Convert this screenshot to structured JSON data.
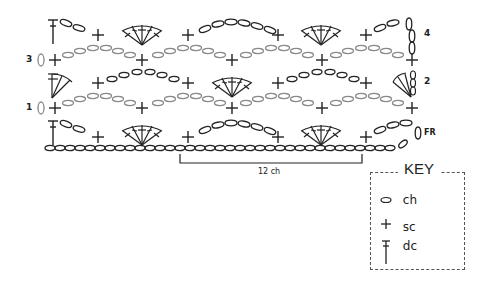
{
  "diagram": {
    "type": "crochet-stitch-chart",
    "row_labels": [
      {
        "id": "4",
        "text": "4",
        "side": "right"
      },
      {
        "id": "3",
        "text": "3",
        "side": "left"
      },
      {
        "id": "2",
        "text": "2",
        "side": "right"
      },
      {
        "id": "1",
        "text": "1",
        "side": "left"
      },
      {
        "id": "FR",
        "text": "FR",
        "side": "right"
      }
    ],
    "repeat_bracket": {
      "label": "12 ch"
    },
    "key": {
      "title": "KEY",
      "items": [
        {
          "symbol": "chain-oval",
          "label": "ch"
        },
        {
          "symbol": "plus",
          "label": "sc"
        },
        {
          "symbol": "dc-t",
          "label": "dc"
        }
      ]
    },
    "colors": {
      "ink": "#222222",
      "gray_ink": "#777777",
      "background": "#ffffff"
    }
  }
}
